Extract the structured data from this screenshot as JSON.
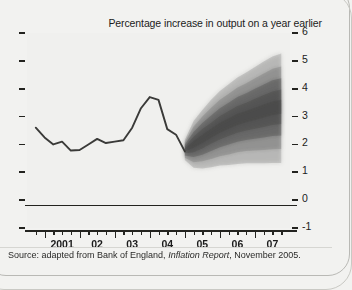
{
  "figure": {
    "title": "Percentage increase in output on a year earlier",
    "source_prefix": "Source: adapted from Bank of England,",
    "source_italic": "Inflation Report",
    "source_suffix": ", November 2005."
  },
  "chart_data": {
    "type": "line",
    "title": "Percentage increase in output on a year earlier",
    "subtitle": "",
    "xlabel": "",
    "ylabel": "",
    "xlim": [
      2000.5,
      2008.0
    ],
    "ylim": [
      -1,
      6
    ],
    "yticks": [
      6,
      5,
      4,
      3,
      2,
      1,
      0,
      -1
    ],
    "ytick_labels": [
      "6",
      "5",
      "4",
      "3",
      "2",
      "1",
      "0",
      "-1"
    ],
    "xtick_labels": [
      "2001",
      "02",
      "03",
      "04",
      "05",
      "06",
      "07"
    ],
    "xtick_values": [
      2001,
      2002,
      2003,
      2004,
      2005,
      2006,
      2007
    ],
    "minor_tick_interval_years": 0.25,
    "grid": false,
    "legend": null,
    "zero_line": 0,
    "series": [
      {
        "name": "GDP growth (history)",
        "type": "line",
        "color": "#3a3a38",
        "x": [
          2000.75,
          2001.0,
          2001.25,
          2001.5,
          2001.75,
          2002.0,
          2002.25,
          2002.5,
          2002.75,
          2003.0,
          2003.25,
          2003.5,
          2003.75,
          2004.0,
          2004.25,
          2004.5,
          2004.75,
          2005.0
        ],
        "y": [
          2.6,
          2.25,
          2.0,
          2.1,
          1.78,
          1.8,
          2.0,
          2.2,
          2.05,
          2.1,
          2.15,
          2.6,
          3.3,
          3.7,
          3.6,
          2.55,
          2.35,
          1.75
        ]
      },
      {
        "name": "GDP growth projection fan",
        "type": "fan",
        "color": "#4a4a48",
        "x": [
          2005.0,
          2005.25,
          2005.5,
          2005.75,
          2006.0,
          2006.25,
          2006.5,
          2006.75,
          2007.0,
          2007.25,
          2007.5,
          2007.75
        ],
        "central": [
          1.8,
          2.0,
          2.2,
          2.4,
          2.6,
          2.75,
          2.9,
          3.0,
          3.1,
          3.2,
          3.3,
          3.35
        ],
        "bands": [
          {
            "percent": 10,
            "lower": [
              1.75,
              1.88,
              2.05,
              2.24,
              2.42,
              2.56,
              2.7,
              2.8,
              2.88,
              2.97,
              3.06,
              3.1
            ],
            "upper": [
              1.85,
              2.12,
              2.35,
              2.56,
              2.78,
              2.94,
              3.1,
              3.2,
              3.32,
              3.43,
              3.54,
              3.6
            ]
          },
          {
            "percent": 30,
            "lower": [
              1.68,
              1.72,
              1.85,
              2.02,
              2.18,
              2.3,
              2.42,
              2.5,
              2.56,
              2.63,
              2.7,
              2.73
            ],
            "upper": [
              1.92,
              2.28,
              2.55,
              2.78,
              3.02,
              3.2,
              3.38,
              3.5,
              3.64,
              3.77,
              3.9,
              3.97
            ]
          },
          {
            "percent": 50,
            "lower": [
              1.6,
              1.55,
              1.63,
              1.76,
              1.9,
              2.0,
              2.1,
              2.16,
              2.2,
              2.25,
              2.3,
              2.32
            ],
            "upper": [
              2.0,
              2.45,
              2.77,
              3.04,
              3.3,
              3.5,
              3.7,
              3.84,
              4.0,
              4.15,
              4.3,
              4.38
            ]
          },
          {
            "percent": 70,
            "lower": [
              1.52,
              1.36,
              1.4,
              1.48,
              1.58,
              1.64,
              1.72,
              1.76,
              1.78,
              1.8,
              1.83,
              1.84
            ],
            "upper": [
              2.08,
              2.64,
              3.0,
              3.32,
              3.6,
              3.82,
              4.04,
              4.2,
              4.38,
              4.55,
              4.72,
              4.8
            ]
          },
          {
            "percent": 90,
            "lower": [
              1.44,
              1.16,
              1.14,
              1.18,
              1.24,
              1.26,
              1.3,
              1.32,
              1.32,
              1.32,
              1.33,
              1.33
            ],
            "upper": [
              2.16,
              2.84,
              3.24,
              3.6,
              3.92,
              4.16,
              4.4,
              4.58,
              4.78,
              4.98,
              5.16,
              5.26
            ]
          }
        ]
      }
    ],
    "annotations": [
      {
        "text": "Source: adapted from Bank of England, Inflation Report, November 2005.",
        "position": "below-axis"
      }
    ]
  }
}
